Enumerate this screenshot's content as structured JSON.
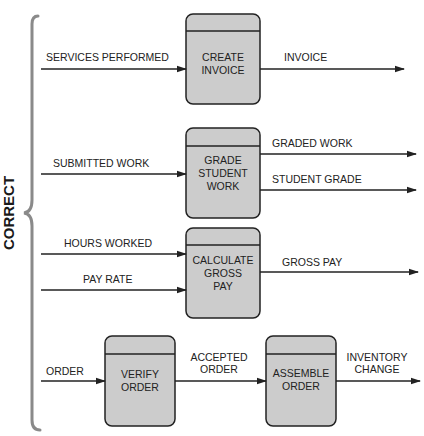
{
  "diagram": {
    "side_label": "CORRECT",
    "colors": {
      "process_fill": "#cccccc",
      "stroke": "#222222",
      "brace": "#8a8a8a"
    },
    "processes": [
      {
        "id": "p1",
        "lines": [
          "CREATE",
          "INVOICE"
        ]
      },
      {
        "id": "p2",
        "lines": [
          "GRADE",
          "STUDENT",
          "WORK"
        ]
      },
      {
        "id": "p3",
        "lines": [
          "CALCULATE",
          "GROSS",
          "PAY"
        ]
      },
      {
        "id": "p4",
        "lines": [
          "VERIFY",
          "ORDER"
        ]
      },
      {
        "id": "p5",
        "lines": [
          "ASSEMBLE",
          "ORDER"
        ]
      }
    ],
    "flows": [
      {
        "label": "SERVICES PERFORMED",
        "to": "p1"
      },
      {
        "label": "INVOICE",
        "from": "p1"
      },
      {
        "label": "SUBMITTED WORK",
        "to": "p2"
      },
      {
        "label": "GRADED WORK",
        "from": "p2"
      },
      {
        "label": "STUDENT GRADE",
        "from": "p2"
      },
      {
        "label": "HOURS WORKED",
        "to": "p3"
      },
      {
        "label": "PAY RATE",
        "to": "p3"
      },
      {
        "label": "GROSS PAY",
        "from": "p3"
      },
      {
        "label": "ORDER",
        "to": "p4"
      },
      {
        "lines": [
          "ACCEPTED",
          "ORDER"
        ],
        "from": "p4",
        "to": "p5"
      },
      {
        "lines": [
          "INVENTORY",
          "CHANGE"
        ],
        "from": "p5"
      }
    ]
  }
}
